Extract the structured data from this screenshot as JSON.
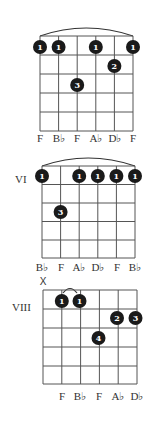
{
  "chords": [
    {
      "position_label": "",
      "muted_string_marker": "",
      "note_labels": [
        "F",
        "B♭",
        "F",
        "A♭",
        "D♭",
        "F"
      ],
      "fingers": [
        {
          "string": 1,
          "fret": 1,
          "finger": "1"
        },
        {
          "string": 2,
          "fret": 1,
          "finger": "1"
        },
        {
          "string": 4,
          "fret": 1,
          "finger": "1"
        },
        {
          "string": 6,
          "fret": 1,
          "finger": "1"
        },
        {
          "string": 5,
          "fret": 2,
          "finger": "2"
        },
        {
          "string": 3,
          "fret": 3,
          "finger": "3"
        }
      ],
      "barre": {
        "from_string": 1,
        "to_string": 6,
        "fret": 1
      }
    },
    {
      "position_label": "VI",
      "muted_string_marker": "",
      "note_labels": [
        "B♭",
        "F",
        "A♭",
        "D♭",
        "F",
        "B♭"
      ],
      "fingers": [
        {
          "string": 1,
          "fret": 1,
          "finger": "1"
        },
        {
          "string": 3,
          "fret": 1,
          "finger": "1"
        },
        {
          "string": 4,
          "fret": 1,
          "finger": "1"
        },
        {
          "string": 5,
          "fret": 1,
          "finger": "1"
        },
        {
          "string": 6,
          "fret": 1,
          "finger": "1"
        },
        {
          "string": 2,
          "fret": 3,
          "finger": "3"
        }
      ],
      "barre": {
        "from_string": 1,
        "to_string": 6,
        "fret": 1
      }
    },
    {
      "position_label": "VIII",
      "muted_string_marker": "X",
      "note_labels": [
        "",
        "F",
        "B♭",
        "F",
        "A♭",
        "D♭"
      ],
      "fingers": [
        {
          "string": 2,
          "fret": 1,
          "finger": "1"
        },
        {
          "string": 3,
          "fret": 1,
          "finger": "1"
        },
        {
          "string": 5,
          "fret": 2,
          "finger": "2"
        },
        {
          "string": 6,
          "fret": 2,
          "finger": "3"
        },
        {
          "string": 4,
          "fret": 3,
          "finger": "4"
        }
      ],
      "barre": {
        "from_string": 2,
        "to_string": 3,
        "fret": 1
      }
    }
  ]
}
